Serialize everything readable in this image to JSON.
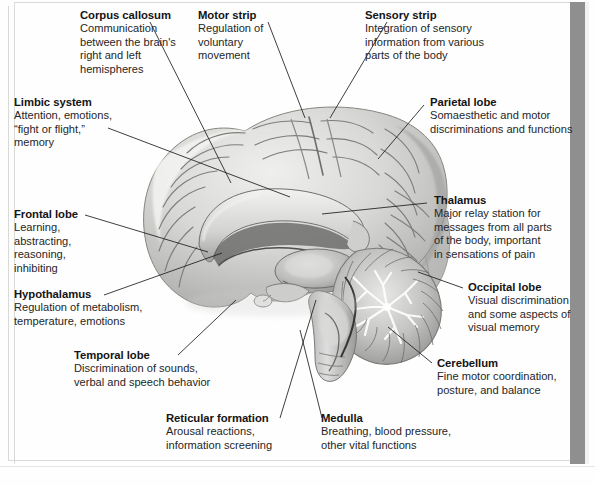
{
  "figure": {
    "type": "anatomical-diagram",
    "view": "midsagittal (medial) section, facing left",
    "style": "grayscale airbrushed medical illustration with leader lines"
  },
  "colors": {
    "page_background": "#fefefe",
    "heading_text": "#141414",
    "body_text": "#262626",
    "leader_line": "#1c1c1c",
    "frame_rule": "#d9dad8",
    "page_edge_bar": "#8e8f8e",
    "brain_light": "#e3e3e1",
    "brain_mid": "#bdbdbb",
    "brain_dark": "#8d8d8b",
    "brain_shadow": "#6d6d6b"
  },
  "labels": [
    {
      "id": "corpus-callosum",
      "heading": "Corpus callosum",
      "body": [
        "Communication",
        "between the brain's",
        "right and left",
        "hemispheres"
      ],
      "position": "top-left",
      "points_to": "corpus callosum (arched white-matter band above thalamus)"
    },
    {
      "id": "motor-strip",
      "heading": "Motor strip",
      "body": [
        "Regulation of",
        "voluntary",
        "movement"
      ],
      "position": "top-center",
      "points_to": "precentral gyrus at the vertex of the cortex"
    },
    {
      "id": "sensory-strip",
      "heading": "Sensory strip",
      "body": [
        "Integration of sensory",
        "information from various",
        "parts of the body"
      ],
      "position": "top-right",
      "points_to": "postcentral gyrus just behind the central sulcus"
    },
    {
      "id": "limbic-system",
      "heading": "Limbic system",
      "body": [
        "Attention, emotions,",
        "“fight or flight,”",
        "memory"
      ],
      "position": "upper-left",
      "points_to": "cingulate / limbic structures around the corpus callosum"
    },
    {
      "id": "parietal-lobe",
      "heading": "Parietal lobe",
      "body": [
        "Somaesthetic and motor",
        "discriminations and functions"
      ],
      "position": "upper-right",
      "points_to": "parietal cortex, posterior-superior region"
    },
    {
      "id": "frontal-lobe",
      "heading": "Frontal lobe",
      "body": [
        "Learning,",
        "abstracting,",
        "reasoning,",
        "inhibiting"
      ],
      "position": "mid-left",
      "points_to": "frontal cortex, anterior region"
    },
    {
      "id": "thalamus",
      "heading": "Thalamus",
      "body": [
        "Major relay station for",
        "messages from all parts",
        "of the body, important",
        "in sensations of pain"
      ],
      "position": "mid-right",
      "points_to": "thalamus, central ovoid mass"
    },
    {
      "id": "hypothalamus",
      "heading": "Hypothalamus",
      "body": [
        "Regulation of metabolism,",
        "temperature, emotions"
      ],
      "position": "lower-left",
      "points_to": "hypothalamus, below the thalamus near the pituitary"
    },
    {
      "id": "occipital-lobe",
      "heading": "Occipital lobe",
      "body": [
        "Visual discrimination",
        "and some aspects of",
        "visual memory"
      ],
      "position": "lower-right",
      "points_to": "occipital cortex, posterior pole"
    },
    {
      "id": "temporal-lobe",
      "heading": "Temporal lobe",
      "body": [
        "Discrimination of sounds,",
        "verbal and speech behavior"
      ],
      "position": "bottom-left",
      "points_to": "temporal cortex, inferior-lateral region"
    },
    {
      "id": "cerebellum",
      "heading": "Cerebellum",
      "body": [
        "Fine motor coordination,",
        "posture, and balance"
      ],
      "position": "bottom-right",
      "points_to": "cerebellum with arbor vitae branching pattern"
    },
    {
      "id": "reticular-formation",
      "heading": "Reticular formation",
      "body": [
        "Arousal reactions,",
        "information screening"
      ],
      "position": "bottom-center-left",
      "points_to": "reticular formation within the brainstem core"
    },
    {
      "id": "medulla",
      "heading": "Medulla",
      "body": [
        "Breathing, blood pressure,",
        "other vital functions"
      ],
      "position": "bottom-center-right",
      "points_to": "medulla oblongata at the base of the brainstem"
    }
  ]
}
